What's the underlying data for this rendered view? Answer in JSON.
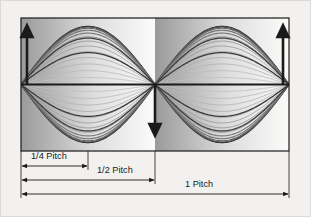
{
  "figure": {
    "type": "technical-diagram",
    "background_color": "#f2f1ef",
    "outer_border_color": "#dcdad6",
    "plot_box": {
      "x": 21,
      "y": 18,
      "width": 268,
      "height": 133,
      "border_color": "#1a1a1a",
      "border_width": 1.2,
      "fill_gradient_light": "#fbfbfa",
      "fill_gradient_dark": "#9a9a9a"
    },
    "centerline": {
      "name": "axis-centerline",
      "y": 84.5,
      "color": "#1a1a1a",
      "width": 2.2
    },
    "nodes": {
      "left_x": 21,
      "center_x": 155,
      "right_x": 289
    },
    "arrows": [
      {
        "name": "amplitude-arrow-left",
        "x": 27,
        "direction": "up",
        "from_y": 84,
        "to_y": 25
      },
      {
        "name": "amplitude-arrow-center",
        "x": 155,
        "direction": "down",
        "from_y": 84,
        "to_y": 137
      },
      {
        "name": "amplitude-arrow-right",
        "x": 283,
        "direction": "up",
        "from_y": 84,
        "to_y": 25
      }
    ],
    "waves": {
      "description": "Standing wave (second mode) sampled at successive instants",
      "count": 14,
      "amplitude_max": 58,
      "darkest_color": "#2b2b2b",
      "lightest_color": "#c8c8c8",
      "wavelength_halves": 2
    },
    "dimensions": [
      {
        "name": "dimension-quarter-pitch",
        "label": "1/4 Pitch",
        "from_x": 21,
        "to_x": 88,
        "line_y": 166,
        "label_x": 31,
        "label_y": 157,
        "label_anchor": "start"
      },
      {
        "name": "dimension-half-pitch",
        "label": "1/2 Pitch",
        "from_x": 21,
        "to_x": 155,
        "line_y": 180,
        "label_x": 97,
        "label_y": 171,
        "label_anchor": "start"
      },
      {
        "name": "dimension-one-pitch",
        "label": "1 Pitch",
        "from_x": 21,
        "to_x": 289,
        "line_y": 194,
        "label_x": 185,
        "label_y": 185,
        "label_anchor": "start"
      }
    ],
    "extension_lines": [
      {
        "name": "extension-line-left",
        "x": 21,
        "from_y": 151,
        "to_y": 198
      },
      {
        "name": "extension-line-quarter",
        "x": 88,
        "from_y": 151,
        "to_y": 170
      },
      {
        "name": "extension-line-center",
        "x": 155,
        "from_y": 151,
        "to_y": 184
      },
      {
        "name": "extension-line-right",
        "x": 289,
        "from_y": 151,
        "to_y": 198
      }
    ],
    "dimension_line_color": "#1a1a1a"
  }
}
